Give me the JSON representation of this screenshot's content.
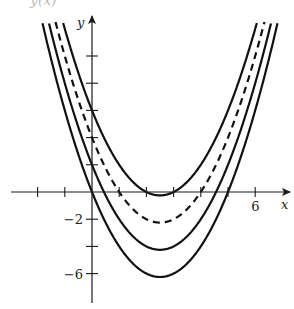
{
  "chart_data": {
    "type": "line",
    "title": "",
    "xlabel": "x",
    "ylabel": "y",
    "x_tick_labels": [
      {
        "value": 6,
        "label": "6"
      }
    ],
    "y_tick_labels": [
      {
        "value": -2,
        "label": "−2"
      },
      {
        "value": -6,
        "label": "−6"
      }
    ],
    "x_ticks": [
      -2,
      -1,
      1,
      2,
      3,
      4,
      5,
      6
    ],
    "y_ticks": [
      -6,
      -4,
      -2,
      2,
      4,
      6,
      8,
      10
    ],
    "xlim": [
      -3,
      7.2
    ],
    "ylim": [
      -8.3,
      13.5
    ],
    "grid": false,
    "legend": null,
    "series": [
      {
        "name": "y = x^2 - 5x + 6",
        "style": "solid",
        "a": 1,
        "b": -5,
        "c": 6,
        "vertex": [
          2.5,
          -0.25
        ]
      },
      {
        "name": "y = x^2 - 5x + 4",
        "style": "dashed",
        "a": 1,
        "b": -5,
        "c": 4,
        "vertex": [
          2.5,
          -2.25
        ]
      },
      {
        "name": "y = x^2 - 5x + 2",
        "style": "solid",
        "a": 1,
        "b": -5,
        "c": 2,
        "vertex": [
          2.5,
          -4.25
        ]
      },
      {
        "name": "y = x^2 - 5x",
        "style": "solid",
        "a": 1,
        "b": -5,
        "c": 0,
        "vertex": [
          2.5,
          -6.25
        ]
      }
    ]
  },
  "header_fragment": "y(x)"
}
